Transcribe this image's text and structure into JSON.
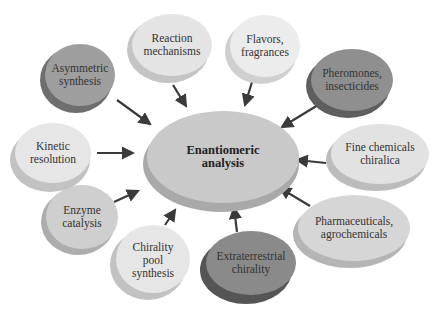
{
  "diagram": {
    "center": {
      "label": "Enantiomeric\nanalysis",
      "fill": "#c9c9c9"
    },
    "nodes": [
      {
        "id": "asymmetric-synthesis",
        "label": "Asymmetric\nsynthesis",
        "fill": "#9e9e9e"
      },
      {
        "id": "reaction-mechanisms",
        "label": "Reaction\nmechanisms",
        "fill": "#e4e4e4"
      },
      {
        "id": "flavors-fragrances",
        "label": "Flavors,\nfragrances",
        "fill": "#ececec"
      },
      {
        "id": "pheromones-insecticides",
        "label": "Pheromones,\ninsecticides",
        "fill": "#8f8f8f"
      },
      {
        "id": "fine-chemicals-chiralica",
        "label": "Fine chemicals\nchiralica",
        "fill": "#e2e2e2"
      },
      {
        "id": "pharmaceuticals-agrochemicals",
        "label": "Pharmaceuticals,\nagrochemicals",
        "fill": "#d6d6d6"
      },
      {
        "id": "extraterrestrial-chirality",
        "label": "Extraterrestrial\nchirality",
        "fill": "#8a8a8a"
      },
      {
        "id": "chirality-pool-synthesis",
        "label": "Chirality\npool\nsynthesis",
        "fill": "#e6e6e6"
      },
      {
        "id": "enzyme-catalysis",
        "label": "Enzyme\ncatalysis",
        "fill": "#cfcfcf"
      },
      {
        "id": "kinetic-resolution",
        "label": "Kinetic\nresolution",
        "fill": "#e6e6e6"
      }
    ],
    "arrow_color": "#3a3a3a"
  }
}
